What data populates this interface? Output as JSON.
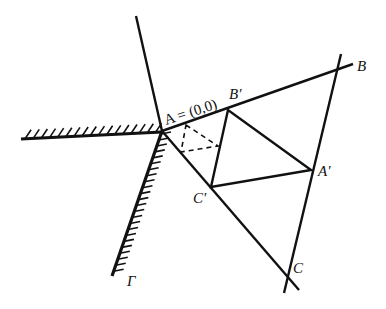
{
  "diagram": {
    "title": "",
    "stroke_color": "#111111",
    "background": "#ffffff",
    "points": {
      "A": {
        "x": 162,
        "y": 131
      },
      "B": {
        "x": 337,
        "y": 69
      },
      "C": {
        "x": 287,
        "y": 279
      },
      "A_prime": {
        "x": 311,
        "y": 170
      },
      "B_prime": {
        "x": 228,
        "y": 110
      },
      "C_prime": {
        "x": 211,
        "y": 187
      },
      "dash_top": {
        "x": 186,
        "y": 125
      },
      "dash_right": {
        "x": 218,
        "y": 146
      },
      "dash_left": {
        "x": 181,
        "y": 152
      }
    },
    "lines": {
      "upper_ray": {
        "x1": 136,
        "y1": 16,
        "x2": 162,
        "y2": 131
      },
      "AB_ext": {
        "x1": 162,
        "y1": 131,
        "x2": 353,
        "y2": 64
      },
      "AC_ext": {
        "x1": 162,
        "y1": 131,
        "x2": 299,
        "y2": 290
      },
      "BC_ext": {
        "x1": 341,
        "y1": 54,
        "x2": 284,
        "y2": 293
      },
      "wall_horizontal": {
        "x1": 21,
        "y1": 139,
        "x2": 162,
        "y2": 132
      },
      "wall_gamma": {
        "x1": 162,
        "y1": 131,
        "x2": 112,
        "y2": 276
      }
    },
    "labels": {
      "A": "A = (0,0)",
      "B": "B",
      "C": "C",
      "A_prime": "A′",
      "B_prime": "B′",
      "C_prime": "C′",
      "Gamma": "Γ"
    },
    "label_positions": {
      "A": {
        "x": 166,
        "y": 125,
        "rotate": -18
      },
      "B": {
        "x": 357,
        "y": 71
      },
      "C": {
        "x": 293,
        "y": 273
      },
      "A_prime": {
        "x": 318,
        "y": 176
      },
      "B_prime": {
        "x": 229,
        "y": 99
      },
      "C_prime": {
        "x": 193,
        "y": 203
      },
      "Gamma": {
        "x": 127,
        "y": 286
      }
    }
  }
}
